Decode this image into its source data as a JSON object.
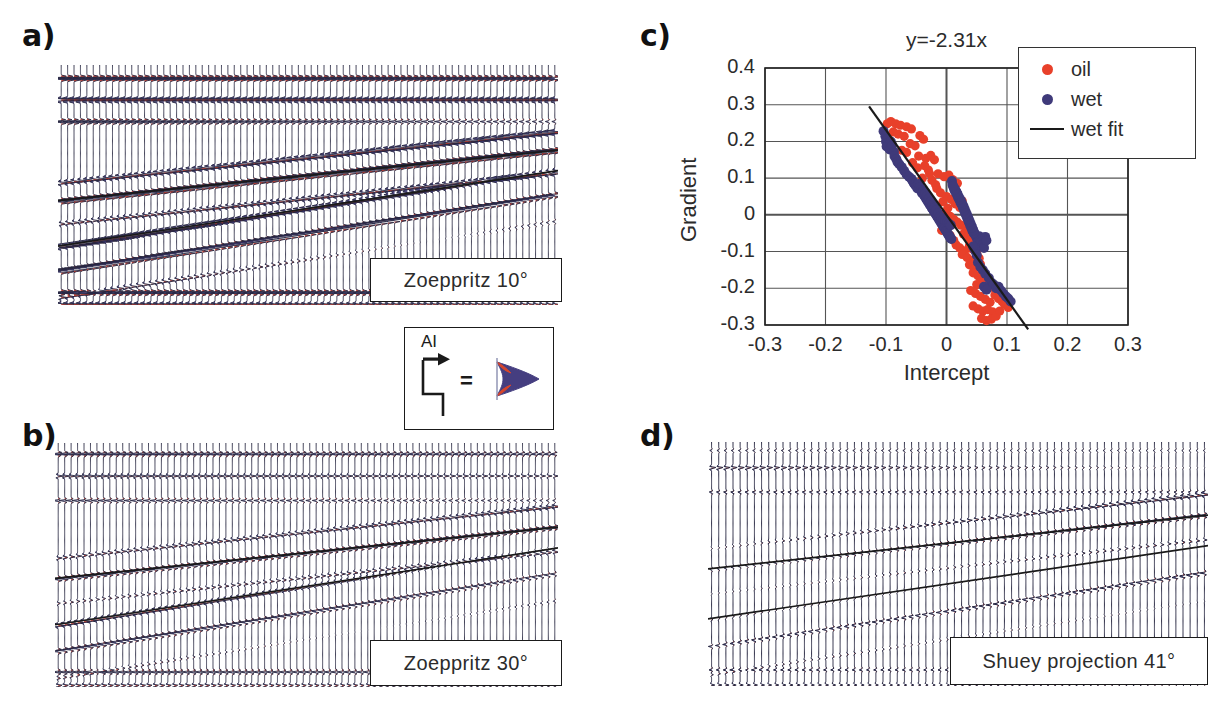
{
  "figure": {
    "panels": [
      {
        "key": "a",
        "label": "a)",
        "caption": "Zoeppritz 10°",
        "type": "seismic-gather"
      },
      {
        "key": "b",
        "label": "b)",
        "caption": "Zoeppritz 30°",
        "type": "seismic-gather"
      },
      {
        "key": "c",
        "label": "c)",
        "caption": "",
        "type": "scatter"
      },
      {
        "key": "d",
        "label": "d)",
        "caption": "Shuey projection 41°",
        "type": "seismic-gather"
      }
    ]
  },
  "ai_key": {
    "label": "AI",
    "equals": "=",
    "arrow_icon": "right-arrow-icon",
    "step_icon": "impedance-step-icon",
    "wavelet_icon": "wavelet-icon"
  },
  "colors": {
    "peak_red": "#c0392b",
    "trough_blue": "#3f3a7a",
    "oil_marker": "#e8402a",
    "wet_marker": "#3f3a7a",
    "fit_line": "#1a1a1a",
    "horizon_line": "#1a1a1a",
    "grid": "#555555",
    "axis": "#222222",
    "text": "#2b2b2b"
  },
  "chart_data": {
    "type": "scatter",
    "title": "y=-2.31x",
    "xlabel": "Intercept",
    "ylabel": "Gradient",
    "xlim": [
      -0.3,
      0.3
    ],
    "ylim": [
      -0.3,
      0.4
    ],
    "xticks": [
      -0.3,
      -0.2,
      -0.1,
      0,
      0.1,
      0.2,
      0.3
    ],
    "xticklabels": [
      "-0.3",
      "-0.2",
      "-0.1",
      "0",
      "0.1",
      "0.2",
      "0.3"
    ],
    "yticks": [
      -0.3,
      -0.2,
      -0.1,
      0,
      0.1,
      0.2,
      0.3,
      0.4
    ],
    "yticklabels": [
      "-0.3",
      "-0.2",
      "-0.1",
      "0",
      "0.1",
      "0.2",
      "0.3",
      "0.4"
    ],
    "grid": true,
    "legend_position": "top-right",
    "legend": [
      {
        "label": "oil",
        "marker": "dot",
        "color": "#e8402a"
      },
      {
        "label": "wet",
        "marker": "dot",
        "color": "#3f3a7a"
      },
      {
        "label": "wet fit",
        "marker": "line",
        "color": "#1a1a1a"
      }
    ],
    "fit": {
      "name": "wet fit",
      "slope": -2.31,
      "intercept": 0,
      "equation": "y=-2.31x",
      "x_start": -0.128,
      "x_end": 0.135
    },
    "series": [
      {
        "name": "wet",
        "color": "#3f3a7a",
        "points": [
          [
            -0.104,
            0.228
          ],
          [
            -0.101,
            0.214
          ],
          [
            -0.1,
            0.2
          ],
          [
            -0.098,
            0.206
          ],
          [
            -0.096,
            0.195
          ],
          [
            -0.099,
            0.186
          ],
          [
            -0.094,
            0.178
          ],
          [
            -0.092,
            0.2
          ],
          [
            -0.09,
            0.19
          ],
          [
            -0.087,
            0.172
          ],
          [
            -0.086,
            0.16
          ],
          [
            -0.083,
            0.152
          ],
          [
            -0.081,
            0.144
          ],
          [
            -0.078,
            0.138
          ],
          [
            -0.074,
            0.13
          ],
          [
            -0.07,
            0.12
          ],
          [
            -0.066,
            0.11
          ],
          [
            -0.062,
            0.104
          ],
          [
            -0.058,
            0.098
          ],
          [
            -0.056,
            0.092
          ],
          [
            -0.054,
            0.086
          ],
          [
            -0.052,
            0.082
          ],
          [
            -0.05,
            0.078
          ],
          [
            -0.048,
            0.072
          ],
          [
            -0.046,
            0.084
          ],
          [
            -0.044,
            0.076
          ],
          [
            -0.042,
            0.068
          ],
          [
            -0.041,
            0.062
          ],
          [
            -0.04,
            0.058
          ],
          [
            -0.038,
            0.066
          ],
          [
            -0.037,
            0.054
          ],
          [
            -0.036,
            0.05
          ],
          [
            -0.035,
            0.06
          ],
          [
            -0.034,
            0.046
          ],
          [
            -0.033,
            0.042
          ],
          [
            -0.032,
            0.052
          ],
          [
            -0.031,
            0.038
          ],
          [
            -0.03,
            0.034
          ],
          [
            -0.029,
            0.044
          ],
          [
            -0.028,
            0.03
          ],
          [
            -0.027,
            0.026
          ],
          [
            -0.026,
            0.036
          ],
          [
            -0.025,
            0.022
          ],
          [
            -0.024,
            0.018
          ],
          [
            -0.023,
            0.028
          ],
          [
            -0.022,
            0.014
          ],
          [
            -0.021,
            0.01
          ],
          [
            -0.02,
            0.02
          ],
          [
            -0.019,
            0.006
          ],
          [
            -0.018,
            0.002
          ],
          [
            -0.017,
            0.012
          ],
          [
            -0.016,
            -0.002
          ],
          [
            -0.015,
            -0.006
          ],
          [
            -0.014,
            0.004
          ],
          [
            -0.013,
            -0.01
          ],
          [
            -0.012,
            -0.014
          ],
          [
            -0.011,
            -0.004
          ],
          [
            -0.01,
            -0.018
          ],
          [
            -0.009,
            -0.022
          ],
          [
            -0.008,
            -0.008
          ],
          [
            -0.007,
            -0.026
          ],
          [
            -0.006,
            -0.03
          ],
          [
            -0.005,
            -0.012
          ],
          [
            -0.004,
            -0.034
          ],
          [
            -0.003,
            -0.038
          ],
          [
            -0.002,
            -0.016
          ],
          [
            -0.001,
            -0.042
          ],
          [
            0.0,
            -0.046
          ],
          [
            0.001,
            -0.02
          ],
          [
            0.002,
            -0.05
          ],
          [
            0.003,
            -0.054
          ],
          [
            0.004,
            -0.024
          ],
          [
            0.005,
            -0.058
          ],
          [
            0.006,
            -0.062
          ],
          [
            0.007,
            -0.028
          ],
          [
            0.008,
            -0.066
          ],
          [
            0.009,
            0.092
          ],
          [
            0.01,
            0.082
          ],
          [
            0.012,
            0.074
          ],
          [
            0.014,
            0.07
          ],
          [
            0.016,
            0.064
          ],
          [
            0.018,
            0.058
          ],
          [
            0.02,
            0.05
          ],
          [
            0.022,
            0.044
          ],
          [
            0.024,
            0.038
          ],
          [
            0.026,
            0.03
          ],
          [
            0.028,
            0.024
          ],
          [
            0.03,
            0.016
          ],
          [
            0.032,
            0.008
          ],
          [
            0.034,
            0.0
          ],
          [
            0.036,
            -0.008
          ],
          [
            0.038,
            -0.016
          ],
          [
            0.04,
            -0.024
          ],
          [
            0.042,
            -0.032
          ],
          [
            0.044,
            -0.04
          ],
          [
            0.046,
            -0.048
          ],
          [
            0.048,
            -0.056
          ],
          [
            0.05,
            -0.064
          ],
          [
            0.052,
            -0.072
          ],
          [
            0.054,
            -0.058
          ],
          [
            0.056,
            -0.066
          ],
          [
            0.058,
            -0.074
          ],
          [
            0.06,
            -0.082
          ],
          [
            0.062,
            -0.09
          ],
          [
            0.064,
            -0.06
          ],
          [
            0.066,
            -0.07
          ],
          [
            0.045,
            -0.05
          ],
          [
            0.043,
            -0.044
          ],
          [
            0.041,
            -0.036
          ],
          [
            0.039,
            -0.028
          ],
          [
            0.037,
            -0.02
          ],
          [
            0.035,
            -0.012
          ],
          [
            0.033,
            -0.004
          ],
          [
            0.031,
            0.004
          ],
          [
            0.029,
            0.012
          ],
          [
            0.027,
            0.02
          ],
          [
            0.025,
            0.028
          ],
          [
            0.023,
            0.034
          ],
          [
            0.021,
            0.042
          ],
          [
            0.019,
            0.048
          ],
          [
            0.017,
            0.056
          ],
          [
            0.015,
            0.062
          ],
          [
            0.013,
            0.068
          ],
          [
            0.011,
            0.078
          ],
          [
            0.052,
            -0.13
          ],
          [
            0.056,
            -0.142
          ],
          [
            0.06,
            -0.15
          ],
          [
            0.064,
            -0.16
          ],
          [
            0.07,
            -0.172
          ],
          [
            0.074,
            -0.184
          ],
          [
            0.078,
            -0.19
          ],
          [
            0.082,
            -0.2
          ],
          [
            0.086,
            -0.196
          ],
          [
            0.09,
            -0.206
          ],
          [
            0.094,
            -0.214
          ],
          [
            0.098,
            -0.222
          ],
          [
            0.102,
            -0.228
          ],
          [
            0.106,
            -0.236
          ],
          [
            0.062,
            -0.196
          ],
          [
            0.066,
            -0.204
          ],
          [
            0.048,
            -0.1
          ],
          [
            0.05,
            -0.11
          ],
          [
            0.046,
            -0.092
          ],
          [
            0.044,
            -0.086
          ]
        ]
      },
      {
        "name": "oil",
        "color": "#e8402a",
        "points": [
          [
            -0.098,
            0.248
          ],
          [
            -0.092,
            0.254
          ],
          [
            -0.084,
            0.248
          ],
          [
            -0.076,
            0.244
          ],
          [
            -0.066,
            0.24
          ],
          [
            -0.058,
            0.234
          ],
          [
            -0.088,
            0.226
          ],
          [
            -0.08,
            0.22
          ],
          [
            -0.07,
            0.214
          ],
          [
            -0.044,
            0.216
          ],
          [
            -0.038,
            0.206
          ],
          [
            -0.06,
            0.194
          ],
          [
            -0.052,
            0.188
          ],
          [
            -0.074,
            0.176
          ],
          [
            -0.066,
            0.17
          ],
          [
            -0.046,
            0.16
          ],
          [
            -0.034,
            0.154
          ],
          [
            -0.026,
            0.162
          ],
          [
            -0.02,
            0.15
          ],
          [
            -0.056,
            0.142
          ],
          [
            -0.048,
            0.128
          ],
          [
            -0.03,
            0.122
          ],
          [
            -0.014,
            0.112
          ],
          [
            -0.004,
            0.104
          ],
          [
            0.004,
            0.108
          ],
          [
            0.01,
            0.096
          ],
          [
            -0.04,
            0.1
          ],
          [
            -0.024,
            0.094
          ],
          [
            0.018,
            0.086
          ],
          [
            0.026,
            0.038
          ],
          [
            0.02,
            0.046
          ],
          [
            -0.016,
            0.072
          ],
          [
            -0.01,
            0.06
          ],
          [
            0.0,
            0.05
          ],
          [
            0.008,
            0.042
          ],
          [
            0.014,
            0.03
          ],
          [
            -0.006,
            0.036
          ],
          [
            0.022,
            0.02
          ],
          [
            0.03,
            0.012
          ],
          [
            0.002,
            0.018
          ],
          [
            -0.002,
            0.004
          ],
          [
            0.006,
            -0.004
          ],
          [
            0.012,
            -0.012
          ],
          [
            0.018,
            -0.02
          ],
          [
            0.024,
            -0.028
          ],
          [
            0.032,
            -0.036
          ],
          [
            0.036,
            -0.044
          ],
          [
            0.028,
            -0.052
          ],
          [
            0.034,
            -0.06
          ],
          [
            0.04,
            -0.068
          ],
          [
            0.046,
            -0.076
          ],
          [
            0.038,
            -0.084
          ],
          [
            0.042,
            -0.092
          ],
          [
            0.03,
            -0.098
          ],
          [
            0.022,
            -0.09
          ],
          [
            0.016,
            -0.082
          ],
          [
            0.026,
            -0.108
          ],
          [
            0.034,
            -0.116
          ],
          [
            0.044,
            -0.124
          ],
          [
            0.05,
            -0.104
          ],
          [
            0.054,
            -0.118
          ],
          [
            0.038,
            -0.136
          ],
          [
            0.046,
            -0.146
          ],
          [
            0.056,
            -0.134
          ],
          [
            0.06,
            -0.156
          ],
          [
            0.052,
            -0.166
          ],
          [
            0.044,
            -0.158
          ],
          [
            0.064,
            -0.17
          ],
          [
            0.058,
            -0.18
          ],
          [
            0.05,
            -0.19
          ],
          [
            0.068,
            -0.186
          ],
          [
            0.072,
            -0.198
          ],
          [
            0.04,
            -0.206
          ],
          [
            0.048,
            -0.214
          ],
          [
            0.056,
            -0.222
          ],
          [
            0.064,
            -0.23
          ],
          [
            0.072,
            -0.238
          ],
          [
            0.08,
            -0.218
          ],
          [
            0.086,
            -0.228
          ],
          [
            0.092,
            -0.236
          ],
          [
            0.052,
            -0.256
          ],
          [
            0.06,
            -0.262
          ],
          [
            0.068,
            -0.258
          ],
          [
            0.076,
            -0.264
          ],
          [
            0.058,
            -0.282
          ],
          [
            0.066,
            -0.288
          ],
          [
            0.074,
            -0.284
          ],
          [
            0.082,
            -0.276
          ],
          [
            0.096,
            -0.244
          ],
          [
            0.102,
            -0.252
          ],
          [
            0.088,
            -0.262
          ],
          [
            0.044,
            -0.248
          ],
          [
            0.012,
            -0.07
          ],
          [
            0.006,
            -0.056
          ],
          [
            -0.008,
            -0.042
          ],
          [
            0.002,
            -0.034
          ],
          [
            -0.018,
            0.082
          ],
          [
            -0.028,
            0.112
          ],
          [
            -0.036,
            0.134
          ],
          [
            0.016,
            0.064
          ]
        ]
      }
    ]
  },
  "seismic": {
    "a": {
      "n_traces": 78,
      "amplitude_scale": 1.0,
      "horizons": [
        {
          "x0": 0.0,
          "y0": 0.565,
          "x1": 1.0,
          "y1": 0.355
        },
        {
          "x0": 0.0,
          "y0": 0.755,
          "x1": 1.0,
          "y1": 0.44
        }
      ]
    },
    "b": {
      "n_traces": 78,
      "amplitude_scale": 0.62,
      "horizons": [
        {
          "x0": 0.0,
          "y0": 0.555,
          "x1": 1.0,
          "y1": 0.345
        },
        {
          "x0": 0.0,
          "y0": 0.745,
          "x1": 1.0,
          "y1": 0.43
        }
      ]
    },
    "d": {
      "n_traces": 70,
      "amplitude_scale": 0.42,
      "horizons": [
        {
          "x0": 0.0,
          "y0": 0.52,
          "x1": 1.0,
          "y1": 0.3
        },
        {
          "x0": 0.0,
          "y0": 0.725,
          "x1": 1.0,
          "y1": 0.425
        }
      ]
    }
  }
}
